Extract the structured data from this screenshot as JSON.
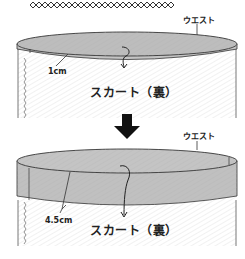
{
  "diagram": {
    "type": "sewing-instruction",
    "colors": {
      "fabric_fill": "#ffffff",
      "fabric_hatch": "#e6e6e6",
      "fold_fill": "#bdbdbd",
      "outline": "#333333",
      "arrow": "#111111"
    },
    "top_panel": {
      "waist_label": "ウエスト",
      "fold_width_label": "1cm",
      "skirt_label": "スカート（裏）"
    },
    "transition_arrow": "down-arrow",
    "bottom_panel": {
      "waist_label": "ウエスト",
      "fold_width_label": "4.5cm",
      "skirt_label": "スカート（裏）"
    }
  }
}
